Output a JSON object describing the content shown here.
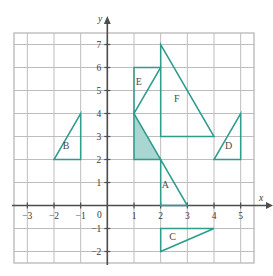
{
  "chart_data": {
    "type": "scatter",
    "title": "",
    "xlabel": "x",
    "ylabel": "y",
    "grid": true,
    "legend": "none",
    "xlim": [
      -3.5,
      5.5
    ],
    "ylim": [
      -2.5,
      7.5
    ],
    "xticks": [
      -3,
      -2,
      -1,
      0,
      1,
      2,
      3,
      4,
      5
    ],
    "yticks": [
      -2,
      -1,
      1,
      2,
      3,
      4,
      5,
      6,
      7
    ],
    "origin_label": "0",
    "shapes": [
      {
        "label": "",
        "name": "shaded-triangle",
        "filled": true,
        "vertices": [
          [
            1,
            4
          ],
          [
            1,
            2
          ],
          [
            2,
            2
          ]
        ],
        "label_at": [
          0,
          0
        ]
      },
      {
        "label": "A",
        "name": "triangle-a",
        "filled": false,
        "vertices": [
          [
            2,
            2
          ],
          [
            2,
            0
          ],
          [
            3,
            0
          ]
        ],
        "label_at": [
          2.18,
          0.75
        ]
      },
      {
        "label": "B",
        "name": "triangle-b",
        "filled": false,
        "vertices": [
          [
            -2,
            2
          ],
          [
            -1,
            2
          ],
          [
            -1,
            4
          ]
        ],
        "label_at": [
          -1.55,
          2.45
        ]
      },
      {
        "label": "C",
        "name": "triangle-c",
        "filled": false,
        "vertices": [
          [
            2,
            -1
          ],
          [
            4,
            -1
          ],
          [
            2,
            -2
          ]
        ],
        "label_at": [
          2.45,
          -1.5
        ]
      },
      {
        "label": "D",
        "name": "triangle-d",
        "filled": false,
        "vertices": [
          [
            4,
            2
          ],
          [
            5,
            2
          ],
          [
            5,
            4
          ]
        ],
        "label_at": [
          4.55,
          2.45
        ]
      },
      {
        "label": "E",
        "name": "triangle-e",
        "filled": false,
        "vertices": [
          [
            1,
            4
          ],
          [
            1,
            6
          ],
          [
            2,
            6
          ]
        ],
        "label_at": [
          1.18,
          5.25
        ]
      },
      {
        "label": "F",
        "name": "triangle-f",
        "filled": false,
        "vertices": [
          [
            2,
            7
          ],
          [
            2,
            3
          ],
          [
            4,
            3
          ]
        ],
        "label_at": [
          2.6,
          4.5
        ]
      }
    ],
    "colors": {
      "shape_stroke": "#2e9b8c",
      "shape_fill": "#a9d6d1",
      "grid": "#bdbdbd",
      "axis": "#4d4d4d",
      "label_text": "#4a4a4a"
    }
  }
}
